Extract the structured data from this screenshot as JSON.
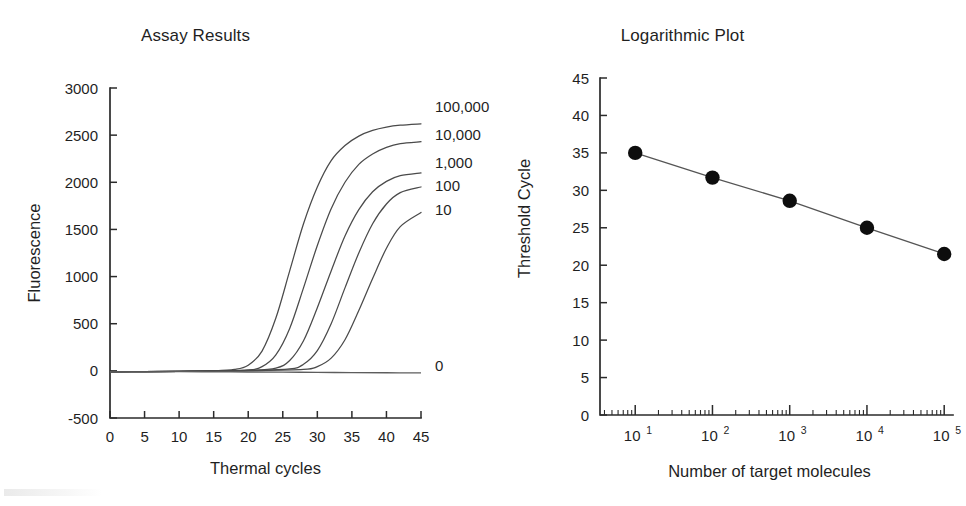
{
  "figure": {
    "background": "#ffffff",
    "ink_color": "#1f1f1f",
    "curve_color": "#4a4a4a",
    "marker_color": "#0d0d0d"
  },
  "chart_data": [
    {
      "type": "line",
      "id": "assay-results",
      "title": "Assay Results",
      "xlabel": "Thermal cycles",
      "ylabel": "Fluorescence",
      "xlim": [
        0,
        45
      ],
      "ylim": [
        -500,
        3000
      ],
      "xticks": [
        "0",
        "5",
        "10",
        "15",
        "20",
        "25",
        "30",
        "35",
        "40",
        "45"
      ],
      "xtick_values": [
        0,
        5,
        10,
        15,
        20,
        25,
        30,
        35,
        40,
        45
      ],
      "yticks": [
        "-500",
        "0",
        "500",
        "1000",
        "1500",
        "2000",
        "2500",
        "3000"
      ],
      "ytick_values": [
        -500,
        0,
        500,
        1000,
        1500,
        2000,
        2500,
        3000
      ],
      "grid": false,
      "legend_position": "right-inline-labels",
      "series": [
        {
          "name": "100,000",
          "label": "100,000",
          "threshold_cycle": 21.5,
          "plateau": 2620,
          "x": [
            0,
            5,
            10,
            15,
            18,
            20,
            22,
            24,
            26,
            28,
            30,
            32,
            34,
            36,
            38,
            40,
            42,
            45
          ],
          "values": [
            -10,
            -8,
            -5,
            0,
            15,
            60,
            210,
            560,
            1060,
            1560,
            1950,
            2230,
            2390,
            2490,
            2550,
            2585,
            2605,
            2620
          ]
        },
        {
          "name": "10,000",
          "label": "10,000",
          "threshold_cycle": 25,
          "plateau": 2430,
          "x": [
            0,
            5,
            10,
            15,
            20,
            22,
            24,
            26,
            28,
            30,
            32,
            34,
            36,
            38,
            40,
            42,
            45
          ],
          "values": [
            -10,
            -8,
            -5,
            0,
            10,
            45,
            170,
            450,
            880,
            1330,
            1720,
            2000,
            2190,
            2300,
            2370,
            2410,
            2430
          ]
        },
        {
          "name": "1,000",
          "label": "1,000",
          "threshold_cycle": 28.6,
          "plateau": 2100,
          "x": [
            0,
            5,
            10,
            15,
            20,
            24,
            26,
            28,
            30,
            32,
            34,
            36,
            38,
            40,
            42,
            45
          ],
          "values": [
            -10,
            -8,
            -5,
            0,
            5,
            30,
            110,
            320,
            670,
            1060,
            1430,
            1710,
            1900,
            2010,
            2070,
            2100
          ]
        },
        {
          "name": "100",
          "label": "100",
          "threshold_cycle": 31.7,
          "plateau": 1950,
          "x": [
            0,
            5,
            10,
            15,
            20,
            26,
            28,
            30,
            32,
            34,
            36,
            38,
            40,
            42,
            45
          ],
          "values": [
            -10,
            -8,
            -5,
            0,
            3,
            20,
            70,
            215,
            500,
            880,
            1250,
            1560,
            1770,
            1890,
            1950
          ]
        },
        {
          "name": "10",
          "label": "10",
          "threshold_cycle": 35,
          "plateau": 1680,
          "x": [
            0,
            5,
            10,
            15,
            20,
            28,
            30,
            32,
            34,
            36,
            38,
            40,
            42,
            45
          ],
          "values": [
            -10,
            -8,
            -5,
            0,
            2,
            15,
            45,
            135,
            330,
            640,
            980,
            1300,
            1530,
            1680
          ]
        },
        {
          "name": "0",
          "label": "0",
          "threshold_cycle": null,
          "plateau": 0,
          "x": [
            0,
            5,
            10,
            15,
            20,
            25,
            30,
            35,
            40,
            45
          ],
          "values": [
            -12,
            -10,
            -8,
            -10,
            -12,
            -14,
            -16,
            -18,
            -20,
            -22
          ]
        }
      ]
    },
    {
      "type": "scatter",
      "id": "logarithmic-plot",
      "title": "Logarithmic Plot",
      "xlabel": "Number of target molecules",
      "ylabel": "Threshold Cycle",
      "xscale": "log",
      "xlim": [
        3.5,
        130000
      ],
      "ylim": [
        0,
        45
      ],
      "xticks": [
        "10^1",
        "10^2",
        "10^3",
        "10^4",
        "10^5"
      ],
      "xtick_values": [
        10,
        100,
        1000,
        10000,
        100000
      ],
      "xtick_mantissa": "10",
      "xtick_exponents": [
        "1",
        "2",
        "3",
        "4",
        "5"
      ],
      "yticks": [
        "0",
        "5",
        "10",
        "15",
        "20",
        "25",
        "30",
        "35",
        "40",
        "45"
      ],
      "ytick_values": [
        0,
        5,
        10,
        15,
        20,
        25,
        30,
        35,
        40,
        45
      ],
      "grid": false,
      "legend_position": "none",
      "x": [
        10,
        100,
        1000,
        10000,
        100000
      ],
      "values": [
        35.0,
        31.7,
        28.6,
        25.0,
        21.5
      ],
      "marker": "filled-circle",
      "connected": true
    }
  ]
}
